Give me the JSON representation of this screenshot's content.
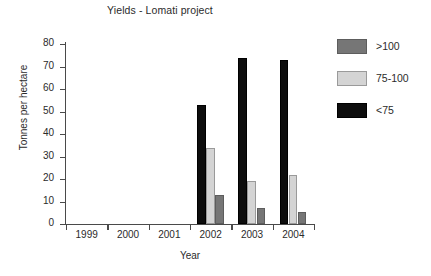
{
  "chart_data": {
    "type": "bar",
    "title": "Yields - Lomati project",
    "xlabel": "Year",
    "ylabel": "Tonnes per hectare",
    "categories": [
      "1999",
      "2000",
      "2001",
      "2002",
      "2003",
      "2004"
    ],
    "series": [
      {
        "name": ">100",
        "color": "#767676",
        "values": [
          0,
          0,
          0,
          13,
          7,
          5.5
        ]
      },
      {
        "name": "75-100",
        "color": "#d4d4d4",
        "values": [
          0,
          0,
          0,
          34,
          19,
          22
        ]
      },
      {
        "name": "<75",
        "color": "#0d0d0d",
        "values": [
          0,
          0,
          0,
          53,
          74,
          73
        ]
      }
    ],
    "ylim": [
      0,
      80
    ],
    "yticks": [
      0,
      10,
      20,
      30,
      40,
      50,
      60,
      70,
      80
    ],
    "ytick_labels": [
      "0",
      "10",
      "20",
      "30",
      "40",
      "50",
      "60",
      "70",
      "80"
    ],
    "grid": false,
    "legend_position": "right",
    "series_draw_order": [
      "<75",
      "75-100",
      ">100"
    ]
  }
}
